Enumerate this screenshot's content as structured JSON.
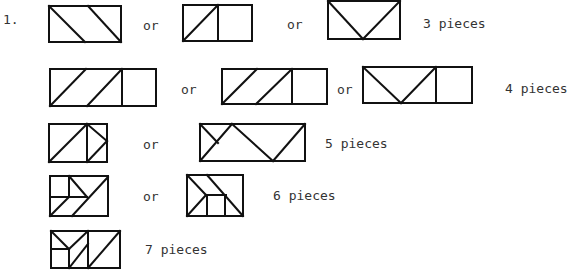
{
  "problem_number": "1.",
  "connector": "or",
  "rows": [
    {
      "pieces_label": "3 pieces"
    },
    {
      "pieces_label": "4 pieces"
    },
    {
      "pieces_label": "5 pieces"
    },
    {
      "pieces_label": "6 pieces"
    },
    {
      "pieces_label": "7 pieces"
    }
  ],
  "colors": {
    "ink": "#111111",
    "text": "#333333",
    "background": "#ffffff"
  }
}
